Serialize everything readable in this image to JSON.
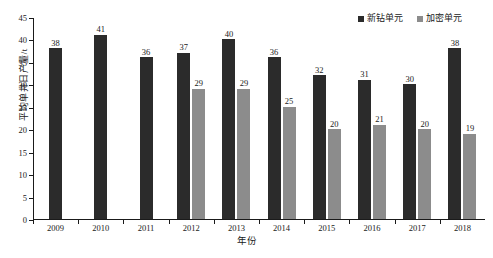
{
  "chart_data": {
    "type": "bar",
    "title": "",
    "xlabel": "年份",
    "ylabel": "平均单井日产量/t",
    "ylim": [
      0,
      45
    ],
    "yticks": [
      0,
      5,
      10,
      15,
      20,
      25,
      30,
      35,
      40,
      45
    ],
    "grid": false,
    "legend_position": "top-right",
    "categories": [
      "2009",
      "2010",
      "2011",
      "2012",
      "2013",
      "2014",
      "2015",
      "2016",
      "2017",
      "2018"
    ],
    "series": [
      {
        "name": "新钻单元",
        "color": "#2b2b2b",
        "values": [
          38,
          41,
          36,
          37,
          40,
          36,
          32,
          31,
          30,
          38
        ],
        "labels": [
          "38",
          "41",
          "36",
          "37",
          "40",
          "36",
          "32",
          "31",
          "30",
          "38"
        ]
      },
      {
        "name": "加密单元",
        "color": "#8c8c8c",
        "values": [
          null,
          null,
          null,
          29,
          29,
          25,
          20,
          21,
          20,
          19
        ],
        "labels": [
          "",
          "",
          "",
          "29",
          "29",
          "25",
          "20",
          "21",
          "20",
          "19"
        ]
      }
    ]
  },
  "legend": {
    "entries": [
      {
        "label": "新钻单元",
        "color": "#2b2b2b"
      },
      {
        "label": "加密单元",
        "color": "#8c8c8c"
      }
    ]
  },
  "axes": {
    "y_title": "平均单井日产量/t",
    "x_title": "年份",
    "y_tick_labels": [
      "0",
      "5",
      "10",
      "15",
      "20",
      "25",
      "30",
      "35",
      "40",
      "45"
    ],
    "x_tick_labels": [
      "2009",
      "2010",
      "2011",
      "2012",
      "2013",
      "2014",
      "2015",
      "2016",
      "2017",
      "2018"
    ]
  },
  "caption": {
    "clipped_text": ""
  }
}
